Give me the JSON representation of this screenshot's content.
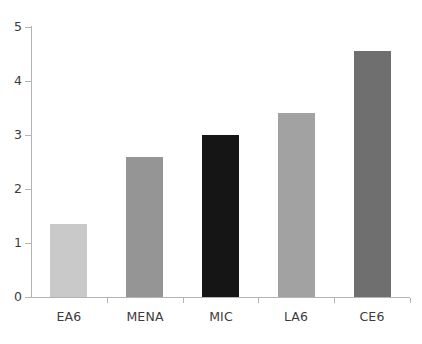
{
  "chart_data": {
    "type": "bar",
    "title": "",
    "subtitle": "",
    "xlabel": "",
    "ylabel": "",
    "categories": [
      "EA6",
      "MENA",
      "MIC",
      "LA6",
      "CE6"
    ],
    "values": [
      1.35,
      2.6,
      3.0,
      3.4,
      4.55
    ],
    "series": [
      {
        "name": "",
        "values": [
          1.35,
          2.6,
          3.0,
          3.4,
          4.55
        ]
      }
    ],
    "bar_colors": [
      "#c9c9c9",
      "#959595",
      "#151515",
      "#a2a2a2",
      "#6f6f6f"
    ],
    "ylim": [
      0,
      5
    ],
    "yticks": [
      0,
      1,
      2,
      3,
      4,
      5
    ],
    "ytick_labels": [
      "0",
      "1",
      "2",
      "3",
      "4",
      "5"
    ],
    "grid": false,
    "legend": false,
    "legend_position": "none",
    "axis_color": "#b4b4b4",
    "text_color": "#3c3c3c",
    "background": "#ffffff"
  }
}
